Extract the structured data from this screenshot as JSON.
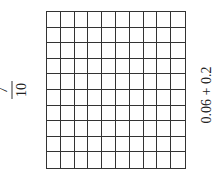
{
  "left_label": {
    "numerator": "7",
    "denominator": "10"
  },
  "right_label": {
    "expression": "0.06 + 0.2"
  },
  "grid": {
    "rows": 10,
    "cols": 10,
    "shaded_cells": 0
  }
}
